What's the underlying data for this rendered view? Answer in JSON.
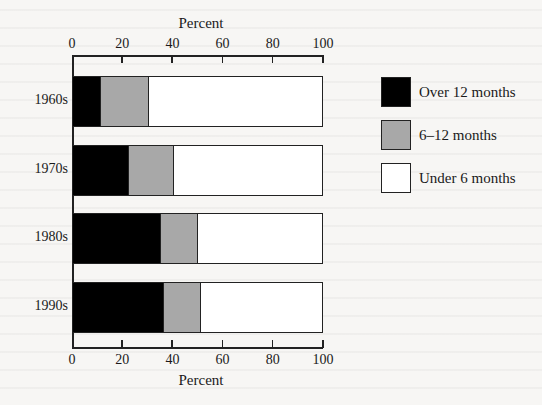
{
  "chart_data": {
    "type": "bar",
    "orientation": "horizontal",
    "stacked": true,
    "title": "",
    "xlabel": "Percent",
    "ylabel": "",
    "xlim": [
      0,
      100
    ],
    "x_ticks": [
      0,
      20,
      40,
      60,
      80,
      100
    ],
    "x_axis_top_label": "Percent",
    "x_axis_bottom_label": "Percent",
    "grid": false,
    "legend_position": "right",
    "categories": [
      "1960s",
      "1970s",
      "1980s",
      "1990s"
    ],
    "series": [
      {
        "name": "Over 12 months",
        "color": "#000000",
        "values": [
          11,
          22,
          35,
          36
        ]
      },
      {
        "name": "6–12 months",
        "color": "#a8a8a8",
        "values": [
          19,
          18,
          15,
          15
        ]
      },
      {
        "name": "Under 6 months",
        "color": "#ffffff",
        "values": [
          70,
          60,
          50,
          49
        ]
      }
    ]
  },
  "axis": {
    "top_title": "Percent",
    "bottom_title": "Percent",
    "ticks": [
      "0",
      "20",
      "40",
      "60",
      "80",
      "100"
    ]
  },
  "legend": [
    {
      "label": "Over 12 months",
      "color": "#000000"
    },
    {
      "label": "6–12 months",
      "color": "#a8a8a8"
    },
    {
      "label": "Under 6 months",
      "color": "#ffffff"
    }
  ]
}
